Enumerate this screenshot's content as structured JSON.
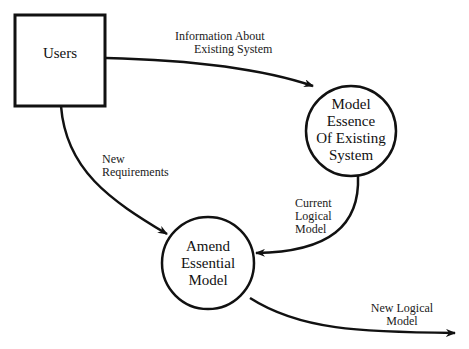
{
  "diagram": {
    "type": "data-flow-diagram",
    "nodes": [
      {
        "id": "users",
        "shape": "rectangle",
        "label": "Users"
      },
      {
        "id": "model_essence",
        "shape": "circle",
        "lines": [
          "Model",
          "Essence",
          "Of Existing",
          "System"
        ]
      },
      {
        "id": "amend_model",
        "shape": "circle",
        "lines": [
          "Amend",
          "Essential",
          "Model"
        ]
      }
    ],
    "flows": [
      {
        "from": "users",
        "to": "model_essence",
        "lines": [
          "Information About",
          "Existing System"
        ]
      },
      {
        "from": "users",
        "to": "amend_model",
        "lines": [
          "New",
          "Requirements"
        ]
      },
      {
        "from": "model_essence",
        "to": "amend_model",
        "lines": [
          "Current",
          "Logical",
          "Model"
        ]
      },
      {
        "from": "amend_model",
        "to": "external",
        "lines": [
          "New Logical",
          "Model"
        ]
      }
    ],
    "colors": {
      "stroke": "#111111",
      "background": "#ffffff"
    }
  }
}
